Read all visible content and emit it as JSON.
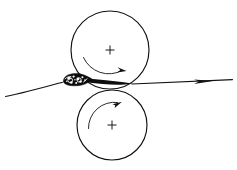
{
  "figure": {
    "caption": "",
    "background_color": "#ffffff",
    "line_color": "#111111",
    "mass_color": "#0d0d0d",
    "width": 237,
    "height": 170
  },
  "chart_data": {
    "type": "diagram",
    "subtitle": "",
    "xlabel": "",
    "ylabel": "",
    "grid": false,
    "legend": "none",
    "elements": [
      {
        "id": "upper-roller",
        "kind": "circle",
        "label": "upper roller",
        "center_x": 110,
        "center_y": 50,
        "radius": 39,
        "center_mark": "+",
        "rotation": "clockwise",
        "rotation_symbol": "↻"
      },
      {
        "id": "lower-roller",
        "kind": "circle",
        "label": "lower roller",
        "center_x": 112,
        "center_y": 125,
        "radius": 35,
        "center_mark": "+",
        "rotation": "counterclockwise",
        "rotation_symbol": "↺"
      },
      {
        "id": "material-bank",
        "kind": "mass",
        "label": "material bank",
        "center_x": 76,
        "center_y": 81,
        "width": 26,
        "height": 13,
        "texture": "speckled"
      },
      {
        "id": "web-entry",
        "kind": "line",
        "label": "web entry",
        "from_x": 6,
        "from_y": 96,
        "to_x": 62,
        "to_y": 81,
        "arrow": false
      },
      {
        "id": "web-exit",
        "kind": "line",
        "label": "web exit",
        "from_x": 130,
        "from_y": 84,
        "to_x": 233,
        "to_y": 80,
        "arrow": true,
        "arrow_direction": "right"
      }
    ],
    "annotations": [
      {
        "text": "+",
        "x": 110,
        "y": 50,
        "target": "upper-roller-center"
      },
      {
        "text": "+",
        "x": 112,
        "y": 125,
        "target": "lower-roller-center"
      }
    ]
  }
}
